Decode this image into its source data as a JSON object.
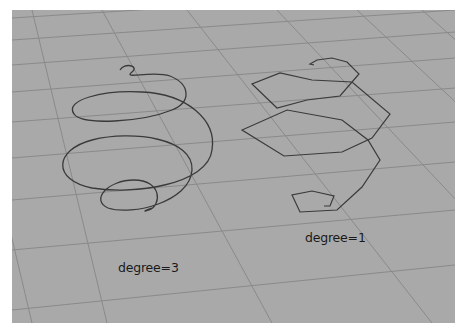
{
  "figure": {
    "background_color": "#a9a9a9",
    "grid_color": "#8a8a8a",
    "curve_color": "#3a3a3a",
    "label_color": "#1a1a1a"
  },
  "curves": [
    {
      "name": "degree-3-spiral",
      "kind": "smooth",
      "label": "degree=3"
    },
    {
      "name": "degree-1-spiral",
      "kind": "polyline",
      "label": "degree=1"
    }
  ]
}
